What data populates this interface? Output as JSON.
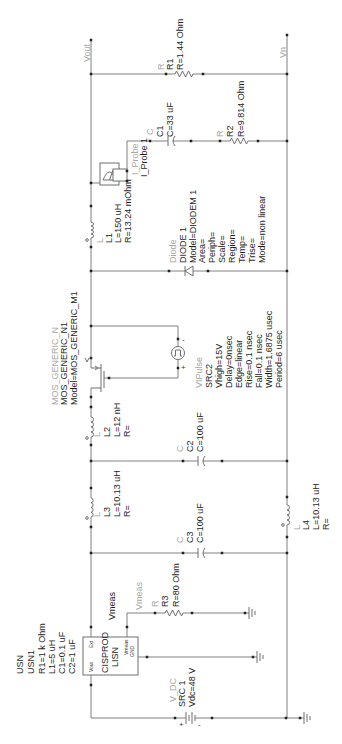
{
  "nets": {
    "vout": "Vout",
    "vn": "Vn",
    "vmeas": "Vmeas",
    "vmeas_wire": "Vmeas"
  },
  "components": {
    "r1": {
      "type": "R",
      "lines": [
        "R1",
        "R=1.44 Ohm"
      ]
    },
    "c1": {
      "type": "C",
      "lines": [
        "C1",
        "C=33 uF"
      ]
    },
    "r2": {
      "type": "R",
      "lines": [
        "R2",
        "R=9.814 Ohm"
      ]
    },
    "i_probe": {
      "type": "I_Probe",
      "lines": [
        "I_Probe 1"
      ]
    },
    "l1": {
      "type": "L",
      "lines": [
        "L1",
        "L=150 uH",
        "R=13.24 mOhm"
      ]
    },
    "diode": {
      "type": "Diode",
      "lines": [
        "DIODE 1",
        "Model=DIODEM 1",
        "Area=",
        "Periph=",
        "Scale=",
        "Region=",
        "Temp=",
        "Trise=",
        "Mode=non linear"
      ]
    },
    "mosfet": {
      "type": "MOS_GENERIC_N",
      "lines": [
        "MOS_GENERIC_N1",
        "Model=MOS_GENERIC_M1"
      ]
    },
    "vtpulse": {
      "type": "VtPulse",
      "lines": [
        "SRC2",
        "Vhigh=15V",
        "Delay=0nsec",
        "Edge=linear",
        "Rise=0.1 nsec",
        "Fall=0.1 nsec",
        "Width=1.6875 usec",
        "Period=6 usec"
      ],
      "pins": {
        "plus": "+",
        "minus": "-"
      }
    },
    "l2": {
      "type": "L",
      "lines": [
        "L2",
        "L=12 nH",
        "R="
      ]
    },
    "c2": {
      "type": "C",
      "lines": [
        "C2",
        "C=100 uF"
      ]
    },
    "l3": {
      "type": "L",
      "lines": [
        "L3",
        "L=10.13 uH",
        "R="
      ]
    },
    "c3": {
      "type": "C",
      "lines": [
        "C3",
        "C=100 uF"
      ]
    },
    "l4": {
      "type": "L",
      "lines": [
        "L4",
        "L=10.13 uH",
        "R="
      ]
    },
    "r3": {
      "type": "R",
      "lines": [
        "R3",
        "R=80 Ohm"
      ]
    },
    "lisn": {
      "type": "USN",
      "lines": [
        "USN1",
        "R1=1 k Ohm",
        "L1=5 uH",
        "C1=0.1 uF",
        "C2=1 uF"
      ],
      "block_title": "CISPROD",
      "block_subtitle": "LISN",
      "pins": {
        "ext": "Ext",
        "vout": "Vout",
        "vmeas": "Vmeas",
        "gnd": "GND"
      }
    },
    "v_dc": {
      "type": "V_DC",
      "lines": [
        "SRC 1",
        "Vdc=48 V"
      ],
      "pins": {
        "plus": "+",
        "minus": "-"
      }
    }
  },
  "colors": {
    "wire": "#808080",
    "label": "#1e1e1e",
    "type_label": "#a6a6a6",
    "background": "#ffffff"
  }
}
